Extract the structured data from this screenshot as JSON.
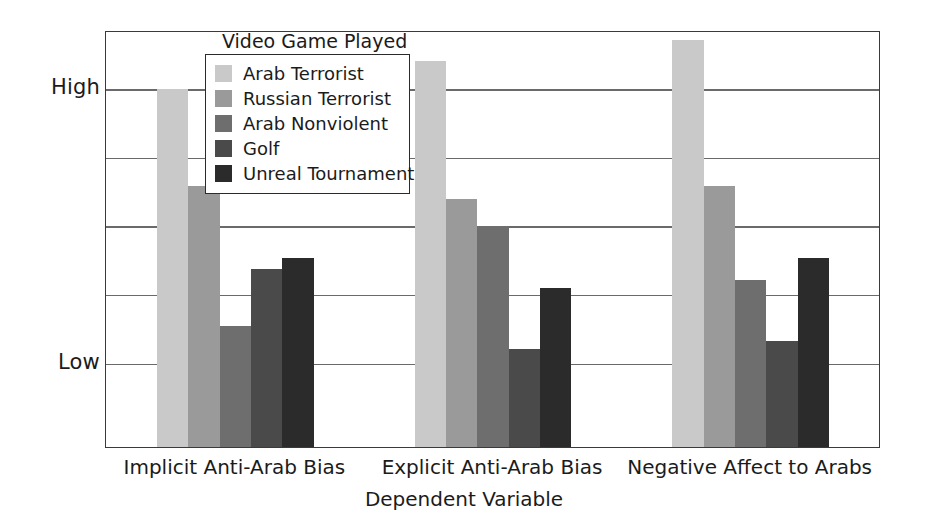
{
  "chart_data": {
    "type": "bar",
    "title": "",
    "legend_title": "Video Game Played",
    "legend_position": "inside-top-center",
    "xlabel": "Dependent Variable",
    "ylabel": "",
    "grid": true,
    "axis": {
      "y_tick_labels": [
        "High",
        "Low"
      ],
      "y_tick_positions": [
        0.862,
        0.2
      ],
      "ylim": [
        0,
        1
      ],
      "gridline_positions": [
        0.862,
        0.697,
        0.532,
        0.367,
        0.2
      ]
    },
    "categories": [
      "Implicit Anti-Arab Bias",
      "Explicit Anti-Arab Bias",
      "Negative Affect to Arabs"
    ],
    "series": [
      {
        "name": "Arab Terrorist",
        "color": "#c9c9c9",
        "values": [
          0.862,
          0.929,
          0.981
        ]
      },
      {
        "name": "Russian Terrorist",
        "color": "#9a9a9a",
        "values": [
          0.63,
          0.597,
          0.63
        ]
      },
      {
        "name": "Arab Nonviolent",
        "color": "#6e6e6e",
        "values": [
          0.292,
          0.532,
          0.403
        ]
      },
      {
        "name": "Golf",
        "color": "#4a4a4a",
        "values": [
          0.429,
          0.237,
          0.256
        ]
      },
      {
        "name": "Unreal Tournament",
        "color": "#2b2b2b",
        "values": [
          0.456,
          0.384,
          0.456
        ]
      }
    ]
  },
  "colors": {
    "plot_border": "#3a3a3a",
    "gridline": "#6a6a6a",
    "background": "#ffffff",
    "text": "#1b1b1b"
  }
}
